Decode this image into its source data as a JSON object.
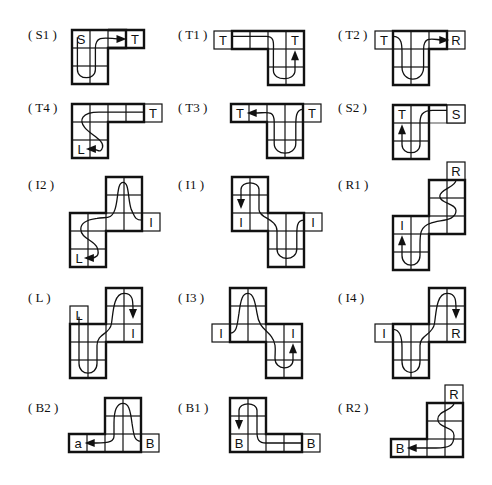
{
  "figure": {
    "cell_size": 18,
    "panels": [
      {
        "id": "S1",
        "label": "( S1 )",
        "lx": 28,
        "ly": 27,
        "ox": 72,
        "oy": 30,
        "cells": [
          [
            0,
            0
          ],
          [
            1,
            0
          ],
          [
            0,
            1
          ],
          [
            1,
            1
          ],
          [
            0,
            2
          ],
          [
            1,
            2
          ]
        ],
        "wing": [
          [
            2,
            0
          ],
          [
            3,
            0
          ]
        ],
        "bold": "M0,0 H3 V1 H2 V3 H0 Z",
        "tabs": [],
        "letters": [
          {
            "t": "S",
            "c": [
              0,
              0
            ]
          },
          {
            "t": "T",
            "c": [
              3,
              0
            ]
          }
        ],
        "path": "M0.3,0.4 V2.2 C0.3,2.8 1.3,2.8 1.3,2.2 V1 C1.3,0.2 2,0.5 2.7,0.5",
        "arrow": {
          "x": 2.75,
          "y": 0.5,
          "dir": "right"
        }
      },
      {
        "id": "T1",
        "label": "( T1 )",
        "lx": 178,
        "ly": 27,
        "ox": 232,
        "oy": 31,
        "cells": [
          [
            0,
            0
          ],
          [
            1,
            0
          ],
          [
            2,
            0
          ],
          [
            3,
            0
          ],
          [
            2,
            1
          ],
          [
            3,
            1
          ],
          [
            2,
            2
          ],
          [
            3,
            2
          ]
        ],
        "bold": "M0,0 H4 V3 H2 V1 H0 Z",
        "tabs": [
          [
            -1,
            0
          ]
        ],
        "letters": [
          {
            "t": "T",
            "c": [
              -1,
              0
            ]
          },
          {
            "t": "T",
            "c": [
              3,
              0
            ]
          }
        ],
        "path": "M0,0.3 H1.9 C2.4,0.3 2.3,0.7 2.3,1.2 V2.2 C2.3,2.8 3.5,2.8 3.5,2.2 V1.5",
        "arrow": {
          "x": 3.5,
          "y": 1.35,
          "dir": "up"
        }
      },
      {
        "id": "T2",
        "label": "( T2 )",
        "lx": 338,
        "ly": 27,
        "ox": 393,
        "oy": 31,
        "cells": [
          [
            0,
            0
          ],
          [
            1,
            0
          ],
          [
            2,
            0
          ],
          [
            0,
            1
          ],
          [
            1,
            1
          ],
          [
            0,
            2
          ],
          [
            1,
            2
          ]
        ],
        "bold": "M0,0 H3 V1 H2 V3 H0 Z",
        "tabs": [
          [
            -1,
            0
          ],
          [
            3,
            0
          ]
        ],
        "letters": [
          {
            "t": "T",
            "c": [
              -1,
              0
            ]
          },
          {
            "t": "R",
            "c": [
              3,
              0
            ]
          }
        ],
        "path": "M0,0.3 C0.5,0.3 0.5,0.8 0.5,1.2 V2 C0.5,2.9 1.7,2.9 1.7,2 V1 C1.7,0.2 2.3,0.5 2.75,0.5",
        "arrow": {
          "x": 2.85,
          "y": 0.5,
          "dir": "right"
        }
      },
      {
        "id": "T4",
        "label": "( T4 )",
        "lx": 28,
        "ly": 100,
        "ox": 72,
        "oy": 104,
        "cells": [
          [
            0,
            0
          ],
          [
            1,
            0
          ],
          [
            2,
            0
          ],
          [
            3,
            0
          ],
          [
            0,
            1
          ],
          [
            1,
            1
          ],
          [
            0,
            2
          ],
          [
            1,
            2
          ]
        ],
        "bold": "M0,0 H4 V1 H2 V3 H0 Z",
        "tabs": [
          [
            4,
            0
          ]
        ],
        "letters": [
          {
            "t": "T",
            "c": [
              4,
              0
            ]
          },
          {
            "t": "L",
            "c": [
              0,
              2
            ]
          }
        ],
        "path": "M4,0.45 H1.5 C0.5,0.45 0.4,0.9 0.7,1.3 C1,1.7 1.8,2 1.7,2.4 C1.6,2.8 1.4,2.5 1.15,2.5",
        "arrow": {
          "x": 1.05,
          "y": 2.5,
          "dir": "left"
        }
      },
      {
        "id": "T3",
        "label": "( T3 )",
        "lx": 178,
        "ly": 100,
        "ox": 231,
        "oy": 104,
        "cells": [
          [
            0,
            0
          ],
          [
            1,
            0
          ],
          [
            2,
            0
          ],
          [
            3,
            0
          ],
          [
            2,
            1
          ],
          [
            3,
            1
          ],
          [
            2,
            2
          ],
          [
            3,
            2
          ]
        ],
        "bold": "M0,0 H4 V3 H2 V1 H0 Z",
        "tabs": [
          [
            4,
            0
          ]
        ],
        "letters": [
          {
            "t": "T",
            "c": [
              0,
              0
            ]
          },
          {
            "t": "T",
            "c": [
              4,
              0
            ]
          }
        ],
        "path": "M4,0.3 C3.6,0.3 3.6,0.8 3.6,1.2 V2.2 C3.6,2.9 2.4,2.9 2.4,2.2 V1 C2.4,0.3 2,0.5 1.3,0.5",
        "arrow": {
          "x": 1.15,
          "y": 0.5,
          "dir": "left"
        }
      },
      {
        "id": "S2",
        "label": "( S2 )",
        "lx": 338,
        "ly": 100,
        "ox": 393,
        "oy": 105,
        "cells": [
          [
            0,
            0
          ],
          [
            1,
            0
          ],
          [
            2,
            0
          ],
          [
            3,
            0
          ],
          [
            0,
            1
          ],
          [
            1,
            1
          ],
          [
            0,
            2
          ],
          [
            1,
            2
          ]
        ],
        "bold": "M0,0 H2 V3 H0 Z M2,0 H3",
        "tabs": [
          [
            3,
            0
          ]
        ],
        "letters": [
          {
            "t": "T",
            "c": [
              0,
              0
            ]
          },
          {
            "t": "S",
            "c": [
              3,
              0
            ]
          }
        ],
        "path": "M3,0.3 H2.2 C1.6,0.3 1.5,0.6 1.5,1 V2.2 C1.5,2.8 0.5,2.8 0.5,2.2 V1.5",
        "arrow": {
          "x": 0.5,
          "y": 1.35,
          "dir": "up"
        }
      },
      {
        "id": "I2",
        "label": "( I2 )",
        "lx": 28,
        "ly": 177,
        "ox": 70,
        "oy": 177,
        "cells": [
          [
            2,
            0
          ],
          [
            3,
            0
          ],
          [
            2,
            1
          ],
          [
            3,
            1
          ],
          [
            0,
            2
          ],
          [
            1,
            2
          ],
          [
            2,
            2
          ],
          [
            3,
            2
          ],
          [
            0,
            3
          ],
          [
            1,
            3
          ],
          [
            0,
            4
          ],
          [
            1,
            4
          ]
        ],
        "bold": "M2,0 H4 V3 H2 V5 H0 V2 H2 Z",
        "tabs": [
          [
            4,
            2
          ]
        ],
        "letters": [
          {
            "t": "I",
            "c": [
              4,
              2
            ]
          },
          {
            "t": "L",
            "c": [
              0,
              4
            ]
          }
        ],
        "path": "M4,2.4 C3.6,2.4 3.6,2.2 3.4,1.8 C3.2,1.2 3.3,0.3 2.95,0.3 C2.6,0.3 2.7,1.2 2.5,1.8 C2.3,2.4 2,2.2 1.5,2.3 C0.8,2.4 0.6,2.6 0.6,2.9 C0.6,3.4 1.3,3.5 1.5,3.9 C1.7,4.4 1.4,4.5 1.15,4.5",
        "arrow": {
          "x": 1.05,
          "y": 4.5,
          "dir": "left"
        }
      },
      {
        "id": "I1",
        "label": "( I1 )",
        "lx": 178,
        "ly": 177,
        "ox": 232,
        "oy": 177,
        "cells": [
          [
            0,
            0
          ],
          [
            1,
            0
          ],
          [
            0,
            1
          ],
          [
            1,
            1
          ],
          [
            0,
            2
          ],
          [
            1,
            2
          ],
          [
            2,
            2
          ],
          [
            3,
            2
          ],
          [
            2,
            3
          ],
          [
            3,
            3
          ],
          [
            2,
            4
          ],
          [
            3,
            4
          ]
        ],
        "bold": "M0,0 H2 V2 H4 V5 H2 V3 H0 Z",
        "tabs": [
          [
            4,
            2
          ]
        ],
        "letters": [
          {
            "t": "I",
            "c": [
              0,
              2
            ]
          },
          {
            "t": "I",
            "c": [
              4,
              2
            ]
          }
        ],
        "path": "M4,2.4 C3.6,2.4 3.6,2.8 3.6,3.2 V4 C3.6,4.7 2.5,4.7 2.5,4 V3 C2.5,2.3 1.5,2.3 1.5,1.8 V0.7 C1.5,0.2 0.5,0.2 0.5,0.7 V1.3",
        "arrow": {
          "x": 0.5,
          "y": 1.5,
          "dir": "down"
        }
      },
      {
        "id": "R1",
        "label": "( R1 )",
        "lx": 338,
        "ly": 177,
        "ox": 393,
        "oy": 216,
        "cells": [
          [
            0,
            0
          ],
          [
            1,
            0
          ],
          [
            0,
            1
          ],
          [
            1,
            1
          ],
          [
            0,
            2
          ],
          [
            1,
            2
          ],
          [
            2,
            -2
          ],
          [
            3,
            -2
          ],
          [
            2,
            -1
          ],
          [
            3,
            -1
          ],
          [
            2,
            0
          ],
          [
            3,
            0
          ]
        ],
        "bold": "M0,0 H2 V-2 H4 V1 H2 V3 H0 Z",
        "tabs": [
          [
            3,
            -3
          ]
        ],
        "letters": [
          {
            "t": "R",
            "c": [
              3,
              -3
            ]
          },
          {
            "t": "I",
            "c": [
              0,
              0
            ]
          }
        ],
        "path": "M3.5,-2 C3.5,-1.6 2.6,-1.5 2.6,-1.1 C2.6,-0.7 3.5,-0.7 3.5,-0.3 C3.5,0.3 2.6,0.2 2.1,0.4 C1.5,0.6 1.5,1 1.5,1.6 V2.2 C1.5,2.9 0.5,2.9 0.5,2.2 V1.5",
        "arrow": {
          "x": 0.5,
          "y": 1.35,
          "dir": "up"
        }
      },
      {
        "id": "L",
        "label": "( L )",
        "lx": 28,
        "ly": 290,
        "ox": 70,
        "oy": 324,
        "cells": [
          [
            0,
            0
          ],
          [
            1,
            0
          ],
          [
            0,
            1
          ],
          [
            1,
            1
          ],
          [
            0,
            2
          ],
          [
            1,
            2
          ],
          [
            2,
            -2
          ],
          [
            3,
            -2
          ],
          [
            2,
            -1
          ],
          [
            3,
            -1
          ],
          [
            2,
            0
          ],
          [
            3,
            0
          ]
        ],
        "bold": "M0,0 H2 V-2 H4 V1 H2 V3 H0 Z",
        "tabs": [
          [
            0,
            -1
          ]
        ],
        "letters": [
          {
            "t": "L",
            "c": [
              0,
              -1
            ]
          },
          {
            "t": "I",
            "c": [
              3,
              0
            ]
          }
        ],
        "path": "M0.5,-0.4 V2.2 C0.5,2.9 1.5,2.9 1.5,2.2 V1.2 C1.5,0.5 2.2,0.6 2.3,0 C2.4,-0.6 2.4,-1.7 3,-1.7 C3.5,-1.7 3.5,-1.3 3.5,-0.8",
        "arrow": {
          "x": 3.5,
          "y": -0.55,
          "dir": "down"
        }
      },
      {
        "id": "I3",
        "label": "( I3 )",
        "lx": 178,
        "ly": 290,
        "ox": 230,
        "oy": 288,
        "cells": [
          [
            0,
            0
          ],
          [
            1,
            0
          ],
          [
            0,
            1
          ],
          [
            1,
            1
          ],
          [
            0,
            2
          ],
          [
            1,
            2
          ],
          [
            2,
            2
          ],
          [
            3,
            2
          ],
          [
            2,
            3
          ],
          [
            3,
            3
          ],
          [
            2,
            4
          ],
          [
            3,
            4
          ]
        ],
        "bold": "M0,0 H2 V2 H4 V5 H2 V3 H0 Z",
        "tabs": [
          [
            -1,
            2
          ]
        ],
        "letters": [
          {
            "t": "I",
            "c": [
              -1,
              2
            ]
          },
          {
            "t": "I",
            "c": [
              3,
              2
            ]
          }
        ],
        "path": "M0,2.5 C0.4,2.5 0.4,2 0.5,1.4 C0.6,0.6 0.7,0.3 1,0.3 C1.3,0.3 1.4,0.8 1.5,1.4 C1.6,2.2 2,2.3 2.3,2.7 C2.6,3.1 2.5,3.5 2.5,3.9 C2.5,4.6 3.5,4.6 3.5,4 V3.5",
        "arrow": {
          "x": 3.5,
          "y": 3.35,
          "dir": "up"
        }
      },
      {
        "id": "I4",
        "label": "( I4 )",
        "lx": 338,
        "ly": 290,
        "ox": 393,
        "oy": 324,
        "cells": [
          [
            0,
            0
          ],
          [
            1,
            0
          ],
          [
            0,
            1
          ],
          [
            1,
            1
          ],
          [
            0,
            2
          ],
          [
            1,
            2
          ],
          [
            2,
            -2
          ],
          [
            3,
            -2
          ],
          [
            2,
            -1
          ],
          [
            3,
            -1
          ],
          [
            2,
            0
          ],
          [
            3,
            0
          ]
        ],
        "bold": "M0,0 H2 V-2 H4 V1 H2 V3 H0 Z",
        "tabs": [
          [
            -1,
            0
          ]
        ],
        "letters": [
          {
            "t": "I",
            "c": [
              -1,
              0
            ]
          },
          {
            "t": "R",
            "c": [
              3,
              0
            ]
          }
        ],
        "path": "M0,0.3 C0.4,0.3 0.5,0.8 0.5,1.3 V2.1 C0.5,2.9 1.5,2.9 1.5,2.1 V1.2 C1.5,0.6 2.2,0.6 2.3,0 C2.4,-0.6 2.4,-1.7 3,-1.7 C3.5,-1.7 3.5,-1.3 3.5,-0.8",
        "arrow": {
          "x": 3.5,
          "y": -0.55,
          "dir": "down"
        }
      },
      {
        "id": "B2",
        "label": "( B2 )",
        "lx": 28,
        "ly": 400,
        "ox": 69,
        "oy": 398,
        "cells": [
          [
            0,
            2
          ],
          [
            1,
            2
          ],
          [
            2,
            2
          ],
          [
            3,
            2
          ],
          [
            2,
            0
          ],
          [
            3,
            0
          ],
          [
            2,
            1
          ],
          [
            3,
            1
          ]
        ],
        "bold": "M0,2 H2 V0 H4 V3 H0 Z",
        "tabs": [
          [
            4,
            2
          ]
        ],
        "letters": [
          {
            "t": "a",
            "c": [
              0,
              2
            ]
          },
          {
            "t": "B",
            "c": [
              4,
              2
            ]
          }
        ],
        "path": "M4,2.4 C3.6,2.4 3.6,2 3.5,1.4 C3.4,0.6 3.3,0.3 3,0.3 C2.7,0.3 2.5,0.6 2.5,1.4 V2.1 C2.5,2.4 2.3,2.5 1.5,2.5 H1.3",
        "arrow": {
          "x": 1.15,
          "y": 2.5,
          "dir": "left"
        }
      },
      {
        "id": "B1",
        "label": "( B1 )",
        "lx": 178,
        "ly": 400,
        "ox": 230,
        "oy": 398,
        "cells": [
          [
            0,
            0
          ],
          [
            1,
            0
          ],
          [
            0,
            1
          ],
          [
            1,
            1
          ],
          [
            0,
            2
          ],
          [
            1,
            2
          ],
          [
            2,
            2
          ],
          [
            3,
            2
          ]
        ],
        "bold": "M0,0 H2 V2 H4 V3 H0 Z",
        "tabs": [
          [
            4,
            2
          ]
        ],
        "letters": [
          {
            "t": "B",
            "c": [
              0,
              2
            ]
          },
          {
            "t": "B",
            "c": [
              4,
              2
            ]
          }
        ],
        "path": "M4,2.5 H2 C1.6,2.5 1.5,2.3 1.5,1.9 V0.7 C1.5,0.2 0.5,0.2 0.5,0.7 V1.3",
        "arrow": {
          "x": 0.5,
          "y": 1.5,
          "dir": "down"
        }
      },
      {
        "id": "R2",
        "label": "( R2 )",
        "lx": 338,
        "ly": 400,
        "ox": 391,
        "oy": 439,
        "cells": [
          [
            0,
            0
          ],
          [
            1,
            0
          ],
          [
            2,
            0
          ],
          [
            3,
            0
          ],
          [
            2,
            -2
          ],
          [
            3,
            -2
          ],
          [
            2,
            -1
          ],
          [
            3,
            -1
          ]
        ],
        "bold": "M0,0 H2 V-2 H4 V1 H0 Z",
        "tabs": [
          [
            3,
            -3
          ]
        ],
        "letters": [
          {
            "t": "R",
            "c": [
              3,
              -3
            ]
          },
          {
            "t": "B",
            "c": [
              0,
              0
            ]
          }
        ],
        "path": "M3.5,-2 C3.5,-1.6 2.6,-1.6 2.6,-1.1 C2.6,-0.6 3.5,-0.7 3.5,-0.2 C3.5,0.4 3.2,0.5 2.5,0.5 H1.3",
        "arrow": {
          "x": 1.15,
          "y": 0.5,
          "dir": "left"
        }
      }
    ]
  }
}
